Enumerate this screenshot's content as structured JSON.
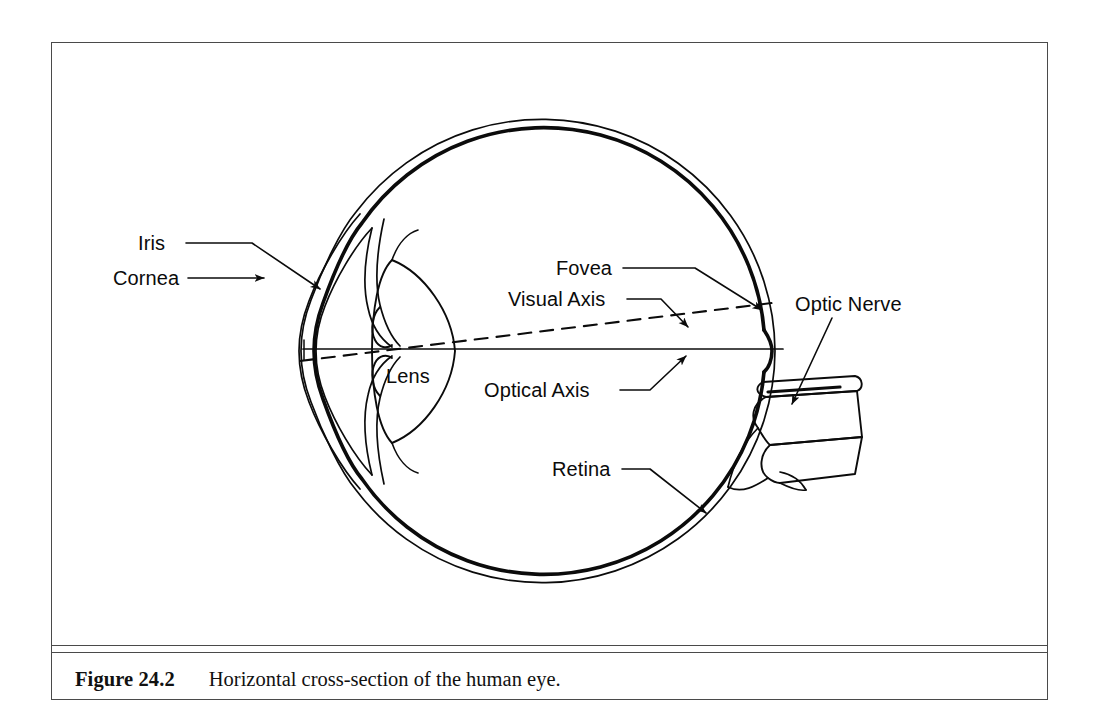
{
  "figure": {
    "caption_number": "Figure 24.2",
    "caption_text": "Horizontal cross-section of the human eye.",
    "frame_color": "#4a4a4a",
    "ink_color": "#0b0b0b",
    "background_color": "#ffffff"
  },
  "diagram": {
    "title": "Horizontal cross-section of the human eye",
    "type": "anatomical-cross-section",
    "labels": {
      "iris": "Iris",
      "cornea": "Cornea",
      "lens": "Lens",
      "fovea": "Fovea",
      "visual_axis": "Visual Axis",
      "optical_axis": "Optical Axis",
      "optic_nerve": "Optic Nerve",
      "retina": "Retina"
    },
    "icons": {
      "iris_leader": "leader-line-icon",
      "cornea_arrow": "arrow-icon",
      "fovea_arrow": "arrow-icon",
      "visual_axis_arrow": "arrow-icon",
      "optical_axis_arrow": "arrow-icon",
      "optic_nerve_arrow": "arrow-icon",
      "retina_arrow": "arrow-icon",
      "optical_axis_line": "solid-line-icon",
      "visual_axis_line": "dashed-line-icon"
    }
  }
}
